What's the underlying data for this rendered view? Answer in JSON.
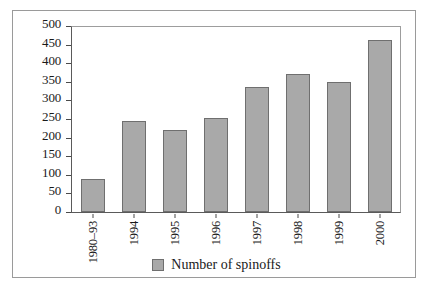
{
  "chart_data": {
    "type": "bar",
    "title": "",
    "xlabel": "",
    "ylabel": "",
    "categories": [
      "1980–93",
      "1994",
      "1995",
      "1996",
      "1997",
      "1998",
      "1999",
      "2000"
    ],
    "values": [
      90,
      245,
      220,
      253,
      335,
      372,
      350,
      462
    ],
    "series": [
      {
        "name": "Number of spinoffs",
        "values": [
          90,
          245,
          220,
          253,
          335,
          372,
          350,
          462
        ]
      }
    ],
    "ylim": [
      0,
      500
    ],
    "ytick_labels": [
      "0",
      "50",
      "100",
      "150",
      "200",
      "250",
      "300",
      "350",
      "400",
      "450",
      "500"
    ],
    "ytick_values": [
      0,
      50,
      100,
      150,
      200,
      250,
      300,
      350,
      400,
      450,
      500
    ],
    "grid": false,
    "legend": {
      "position": "bottom",
      "entries": [
        {
          "label": "Number of spinoffs",
          "color": "#a9a9a9"
        }
      ]
    },
    "colors": {
      "bar_fill": "#a9a9a9",
      "bar_stroke": "#6f6f6f",
      "axis": "#4a4a4a",
      "frame": "#9a9a9a",
      "background": "#ffffff",
      "text": "#1a1a1a"
    }
  }
}
